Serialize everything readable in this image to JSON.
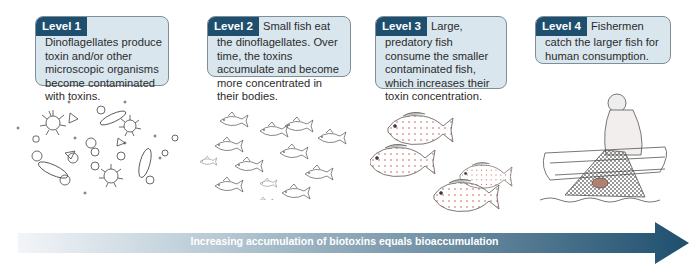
{
  "levels": [
    {
      "tag": "Level 1",
      "text": "Dinoflagellates produce toxin and/or other microscopic organisms become contaminated with toxins.",
      "illustration": "microorganisms-dinoflagellates"
    },
    {
      "tag": "Level 2",
      "text": "Small fish eat the dinoflagellates. Over time, the toxins accumulate and become more concentrated in their bodies.",
      "illustration": "school-of-small-fish"
    },
    {
      "tag": "Level 3",
      "text": "Large, predatory fish consume the smaller contaminated fish, which increases their toxin concentration.",
      "illustration": "large-predatory-fish"
    },
    {
      "tag": "Level 4",
      "text": "Fishermen catch the larger fish for human consumption.",
      "illustration": "fisherman-with-net"
    }
  ],
  "arrow": {
    "label": "Increasing accumulation of biotoxins equals bioaccumulation",
    "color_start": "#e6edf2",
    "color_end": "#1e4f6e"
  },
  "colors": {
    "tag_bg": "#1e4f6e",
    "card_bg": "#d9e6ee",
    "card_border": "#7f8f99"
  }
}
